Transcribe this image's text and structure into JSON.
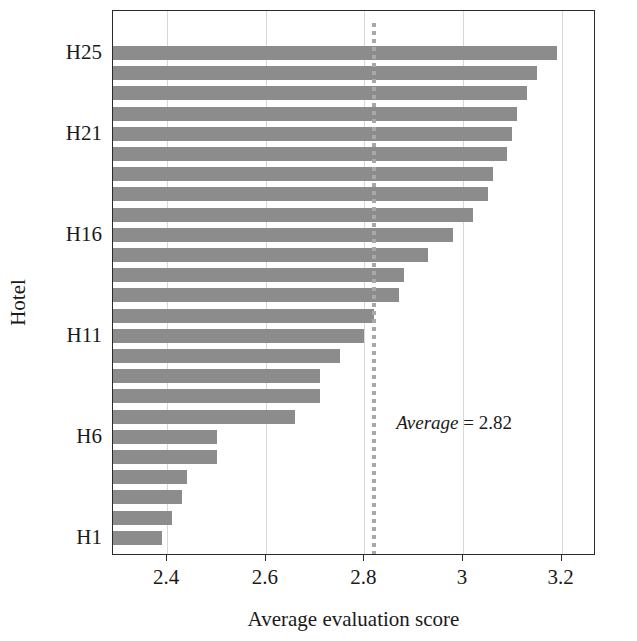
{
  "chart_data": {
    "type": "bar",
    "orientation": "horizontal",
    "title": "",
    "xlabel": "Average evaluation score",
    "ylabel": "Hotel",
    "xlim": [
      2.29,
      3.27
    ],
    "xticks": [
      2.4,
      2.6,
      2.8,
      3,
      3.2
    ],
    "xticklabels": [
      "2.4",
      "2.6",
      "2.8",
      "3",
      "3.2"
    ],
    "yticklabels": [
      "H1",
      "H6",
      "H11",
      "H16",
      "H21",
      "H25"
    ],
    "ytick_categories": [
      "H1",
      "H6",
      "H11",
      "H16",
      "H21",
      "H25"
    ],
    "grid": "vertical",
    "legend": "none",
    "bar_color": "#8c8c8c",
    "categories": [
      "H1",
      "H2",
      "H3",
      "H4",
      "H5",
      "H6",
      "H7",
      "H8",
      "H9",
      "H10",
      "H11",
      "H12",
      "H13",
      "H14",
      "H15",
      "H16",
      "H17",
      "H18",
      "H19",
      "H20",
      "H21",
      "H22",
      "H23",
      "H24",
      "H25"
    ],
    "values": [
      2.39,
      2.41,
      2.43,
      2.44,
      2.5,
      2.5,
      2.66,
      2.71,
      2.71,
      2.75,
      2.8,
      2.82,
      2.87,
      2.88,
      2.93,
      2.98,
      3.02,
      3.05,
      3.06,
      3.09,
      3.1,
      3.11,
      3.13,
      3.15,
      3.19
    ],
    "annotations": [
      {
        "type": "reference-line",
        "value": 2.82,
        "style": "dotted",
        "color": "#a8a8a8",
        "label_prefix": "Average",
        "label_separator": "=",
        "label_value": "2.82",
        "label": "Average = 2.82"
      }
    ]
  },
  "axes": {
    "x_title": "Average evaluation score",
    "y_title": "Hotel",
    "x_tick_labels": [
      "2.4",
      "2.6",
      "2.8",
      "3",
      "3.2"
    ],
    "y_tick_labels": [
      "H25",
      "H21",
      "H16",
      "H11",
      "H6",
      "H1"
    ]
  },
  "annotation": {
    "average_word": "Average",
    "equals": "= 2.82"
  }
}
